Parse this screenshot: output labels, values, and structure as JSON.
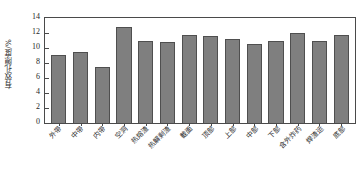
{
  "chart_data": {
    "type": "bar",
    "title": "",
    "subtitle": "",
    "xlabel": "",
    "ylabel": "有效孔隙度/%",
    "ylim": [
      0,
      14
    ],
    "yticks": [
      0,
      2,
      4,
      6,
      8,
      10,
      12,
      14
    ],
    "ytick_labels": [
      "0",
      "2",
      "4",
      "6",
      "8",
      "10",
      "12",
      "14"
    ],
    "grid": false,
    "legend": false,
    "bar_color": "#7f7f7f",
    "bar_edge_color": "#4f4f4f",
    "frame_color": "#4a4a4a",
    "categories": [
      "外带",
      "中带",
      "内带",
      "空洞",
      "热熔渣",
      "热解剩渣",
      "截面",
      "顶部",
      "上部",
      "中部",
      "下部",
      "含外炸药",
      "焊渣运",
      "底部"
    ],
    "values": [
      9.1,
      9.5,
      7.5,
      12.8,
      10.9,
      10.8,
      11.8,
      11.65,
      11.15,
      10.5,
      10.9,
      11.95,
      11.0,
      11.7
    ]
  }
}
